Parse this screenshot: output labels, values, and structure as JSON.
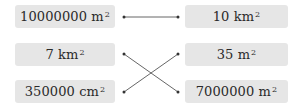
{
  "left_items": [
    {
      "value": "10000000",
      "unit": "m",
      "exp": "2"
    },
    {
      "value": "7",
      "unit": "km",
      "exp": "2"
    },
    {
      "value": "350000",
      "unit": "cm",
      "exp": "2"
    }
  ],
  "right_items": [
    {
      "value": "10",
      "unit": "km",
      "exp": "2"
    },
    {
      "value": "35",
      "unit": "m",
      "exp": "2"
    },
    {
      "value": "7000000",
      "unit": "m",
      "exp": "2"
    }
  ],
  "connections": [
    {
      "from_left": 0,
      "to_right": 0
    },
    {
      "from_left": 1,
      "to_right": 2
    },
    {
      "from_left": 2,
      "to_right": 1
    }
  ],
  "colors": {
    "box_bg": "#e6e6e6",
    "text": "#2a2a2a",
    "line": "#555555",
    "dot": "#333333"
  }
}
